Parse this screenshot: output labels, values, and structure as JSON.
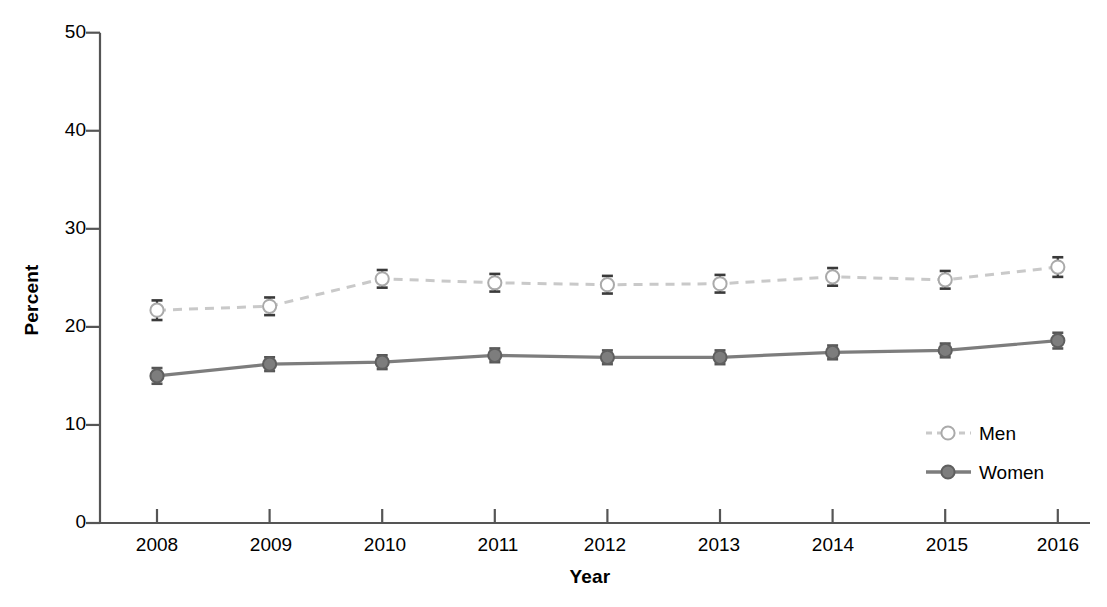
{
  "chart_data": {
    "type": "line",
    "title": "",
    "xlabel": "Year",
    "ylabel": "Percent",
    "categories": [
      "2008",
      "2009",
      "2010",
      "2011",
      "2012",
      "2013",
      "2014",
      "2015",
      "2016"
    ],
    "xlim": [
      2007.5,
      2016.5
    ],
    "ylim": [
      0,
      50
    ],
    "yticks": [
      0,
      10,
      20,
      30,
      40,
      50
    ],
    "ytick_labels": [
      "0",
      "10",
      "20",
      "30",
      "40",
      "50"
    ],
    "grid": false,
    "legend_position": "lower right",
    "series": [
      {
        "name": "Men",
        "color": "#c9c9c9",
        "marker": "open-circle",
        "linestyle": "dashed",
        "values": [
          21.7,
          22.1,
          24.9,
          24.5,
          24.3,
          24.4,
          25.1,
          24.8,
          26.1
        ],
        "err_low": [
          1.0,
          0.9,
          0.9,
          0.9,
          0.9,
          0.9,
          0.9,
          0.9,
          1.0
        ],
        "err_high": [
          1.0,
          0.9,
          0.9,
          0.9,
          0.9,
          0.9,
          0.9,
          0.9,
          1.0
        ]
      },
      {
        "name": "Women",
        "color": "#7d7d7d",
        "marker": "filled-circle",
        "linestyle": "solid",
        "values": [
          15.0,
          16.2,
          16.4,
          17.1,
          16.9,
          16.9,
          17.4,
          17.6,
          18.6
        ],
        "err_low": [
          0.8,
          0.7,
          0.7,
          0.7,
          0.7,
          0.7,
          0.7,
          0.7,
          0.8
        ],
        "err_high": [
          0.8,
          0.7,
          0.7,
          0.7,
          0.7,
          0.7,
          0.7,
          0.7,
          0.8
        ]
      }
    ]
  },
  "legend": {
    "entries": [
      {
        "label": "Men"
      },
      {
        "label": "Women"
      }
    ]
  },
  "axes": {
    "y_title": "Percent",
    "x_title": "Year",
    "ytick_0": "0",
    "ytick_1": "10",
    "ytick_2": "20",
    "ytick_3": "30",
    "ytick_4": "40",
    "ytick_5": "50",
    "xtick_0": "2008",
    "xtick_1": "2009",
    "xtick_2": "2010",
    "xtick_3": "2011",
    "xtick_4": "2012",
    "xtick_5": "2013",
    "xtick_6": "2014",
    "xtick_7": "2015",
    "xtick_8": "2016"
  },
  "colors": {
    "men_line": "#c9c9c9",
    "women_line": "#7d7d7d",
    "axis": "#555555",
    "text": "#000000"
  }
}
